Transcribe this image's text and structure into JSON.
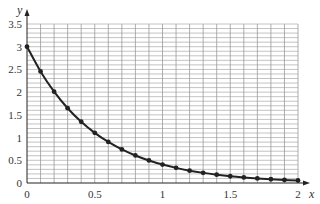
{
  "chart_data": {
    "type": "line",
    "title": "",
    "xlabel": "x",
    "ylabel": "y",
    "function": "y = 3e^(-2x)",
    "xlim": [
      0,
      2
    ],
    "ylim": [
      0,
      3.5
    ],
    "grid": true,
    "grid_minor_step_x": 0.1,
    "grid_minor_step_y": 0.1,
    "x_ticks": [
      "0",
      "0.5",
      "1",
      "1.5",
      "2"
    ],
    "x_tick_values": [
      0,
      0.5,
      1,
      1.5,
      2
    ],
    "y_ticks": [
      "0",
      "0.5",
      "1",
      "1.5",
      "2",
      "2.5",
      "3",
      "3.5"
    ],
    "y_tick_values": [
      0,
      0.5,
      1,
      1.5,
      2,
      2.5,
      3,
      3.5
    ],
    "series": [
      {
        "name": "curve",
        "markers": true,
        "x": [
          0,
          0.1,
          0.2,
          0.3,
          0.4,
          0.5,
          0.6,
          0.7,
          0.8,
          0.9,
          1.0,
          1.1,
          1.2,
          1.3,
          1.4,
          1.5,
          1.6,
          1.7,
          1.8,
          1.9,
          2.0
        ],
        "values": [
          3.0,
          2.456,
          2.011,
          1.646,
          1.348,
          1.104,
          0.904,
          0.74,
          0.606,
          0.496,
          0.406,
          0.333,
          0.272,
          0.223,
          0.183,
          0.149,
          0.122,
          0.1,
          0.082,
          0.067,
          0.055
        ]
      }
    ],
    "colors": {
      "curve": "#222222",
      "grid": "#9a9a9a",
      "axis": "#222222"
    }
  }
}
